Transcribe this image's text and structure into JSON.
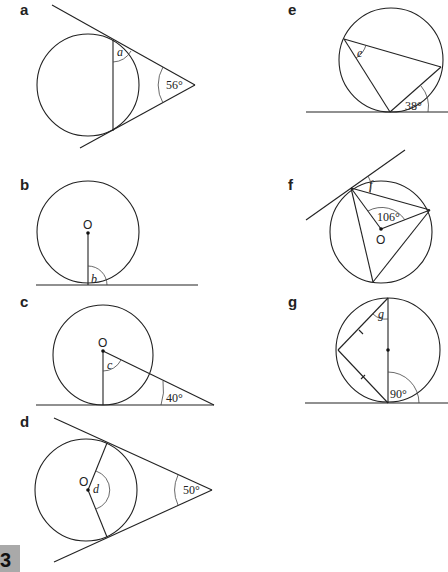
{
  "page": {
    "number": "3",
    "box_color": "#a9a9a9"
  },
  "diagrams": {
    "a": {
      "label": "a",
      "unknown": "a",
      "given_angle": "56°",
      "description": "Two tangents from external point meet at 56°; chord joins tangent points; find angle a between tangent and chord"
    },
    "b": {
      "label": "b",
      "center": "O",
      "unknown": "b",
      "description": "Radius from centre O meets tangent line; find angle b"
    },
    "c": {
      "label": "c",
      "center": "O",
      "unknown": "c",
      "given_angle": "40°",
      "description": "Radius to tangent point and line from centre to external point on tangent making 40°; find angle c"
    },
    "d": {
      "label": "d",
      "center": "O",
      "unknown": "d",
      "given_angle": "50°",
      "description": "Two tangents meet at 50°; radii to tangent points form angle d at centre"
    },
    "e": {
      "label": "e",
      "unknown": "e",
      "given_angle": "38°",
      "description": "Tangent-chord angle 38°; inscribed angle e in alternate segment"
    },
    "f": {
      "label": "f",
      "center": "O",
      "unknown": "f",
      "given_angle": "106°",
      "description": "Central angle 106°; tangent at vertex; find angle f between tangent and chord"
    },
    "g": {
      "label": "g",
      "unknown": "g",
      "given_angle": "90°",
      "description": "Diameter perpendicular to tangent; isosceles triangle with equal-tick sides; find angle g"
    }
  }
}
